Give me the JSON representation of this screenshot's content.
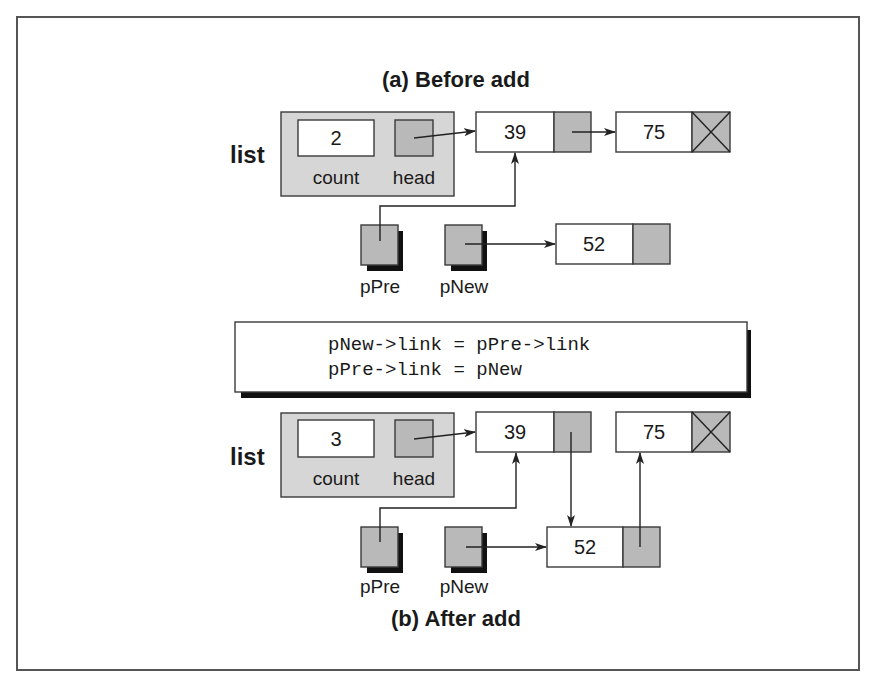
{
  "diagram": {
    "title_before": "(a) Before add",
    "title_after": "(b) After add",
    "colors": {
      "frame": "#555555",
      "node_fill": "#ffffff",
      "pointer_fill": "#b9b9b9",
      "list_header_fill": "#d6d6d6",
      "shadow": "#111111"
    },
    "before": {
      "list_label": "list",
      "count_value": "2",
      "count_label": "count",
      "head_label": "head",
      "nodes": [
        {
          "data": "39",
          "link": "pointer"
        },
        {
          "data": "75",
          "link": "null"
        }
      ],
      "new_node": {
        "data": "52",
        "link": "empty"
      },
      "pointers": [
        {
          "name": "pPre",
          "points_to": "39"
        },
        {
          "name": "pNew",
          "points_to": "52"
        }
      ]
    },
    "code": {
      "lines": [
        "pNew->link = pPre->link",
        "pPre->link = pNew"
      ]
    },
    "after": {
      "list_label": "list",
      "count_value": "3",
      "count_label": "count",
      "head_label": "head",
      "nodes": [
        {
          "data": "39",
          "link": "52"
        },
        {
          "data": "52",
          "link": "75"
        },
        {
          "data": "75",
          "link": "null"
        }
      ],
      "pointers": [
        {
          "name": "pPre",
          "points_to": "39"
        },
        {
          "name": "pNew",
          "points_to": "52"
        }
      ]
    }
  }
}
